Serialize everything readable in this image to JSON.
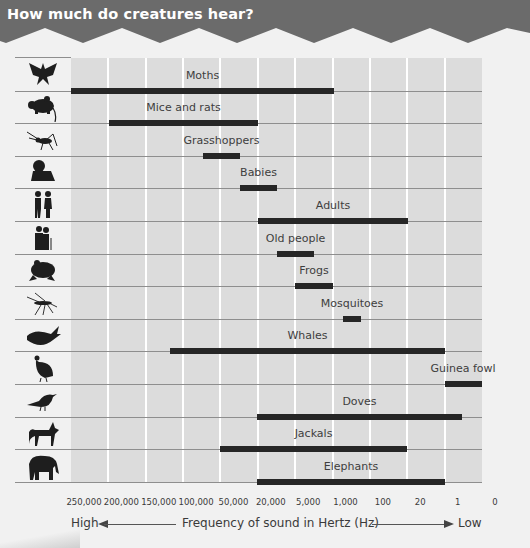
{
  "header": {
    "title": "How much do creatures hear?",
    "color": "#6b6b6b"
  },
  "axis": {
    "high_label": "High",
    "low_label": "Low",
    "xlabel": "Frequency of sound in Hertz (Hz)",
    "ticks": [
      "250,000",
      "200,000",
      "150,000",
      "100,000",
      "50,000",
      "20,000",
      "5,000",
      "1,000",
      "100",
      "20",
      "1",
      "0"
    ]
  },
  "rows": [
    {
      "label": "Moths",
      "icon": "moth-icon"
    },
    {
      "label": "Mice and rats",
      "icon": "mouse-icon"
    },
    {
      "label": "Grasshoppers",
      "icon": "grasshopper-icon"
    },
    {
      "label": "Babies",
      "icon": "baby-icon"
    },
    {
      "label": "Adults",
      "icon": "adults-icon"
    },
    {
      "label": "Old people",
      "icon": "old-people-icon"
    },
    {
      "label": "Frogs",
      "icon": "frog-icon"
    },
    {
      "label": "Mosquitoes",
      "icon": "mosquito-icon"
    },
    {
      "label": "Whales",
      "icon": "whale-icon"
    },
    {
      "label": "Guinea fowl",
      "icon": "guinea-fowl-icon"
    },
    {
      "label": "Doves",
      "icon": "dove-icon"
    },
    {
      "label": "Jackals",
      "icon": "jackal-icon"
    },
    {
      "label": "Elephants",
      "icon": "elephant-icon"
    }
  ],
  "chart_data": {
    "type": "bar",
    "orientation": "horizontal-range",
    "title": "How much do creatures hear?",
    "xlabel": "Frequency of sound in Hertz (Hz)",
    "ylabel": "",
    "x_direction": "High (left) to Low (right)",
    "x_ticks": [
      "250,000",
      "200,000",
      "150,000",
      "100,000",
      "50,000",
      "20,000",
      "5,000",
      "1,000",
      "100",
      "20",
      "1",
      "0"
    ],
    "grid": "vertical",
    "legend": "none",
    "categories": [
      "Moths",
      "Mice and rats",
      "Grasshoppers",
      "Babies",
      "Adults",
      "Old people",
      "Frogs",
      "Mosquitoes",
      "Whales",
      "Guinea fowl",
      "Doves",
      "Jackals",
      "Elephants"
    ],
    "ranges": [
      {
        "name": "Moths",
        "high_hz": 250000,
        "low_hz": 1000
      },
      {
        "name": "Mice and rats",
        "high_hz": 200000,
        "low_hz": 20000
      },
      {
        "name": "Grasshoppers",
        "high_hz": 75000,
        "low_hz": 50000
      },
      {
        "name": "Babies",
        "high_hz": 50000,
        "low_hz": 12000
      },
      {
        "name": "Adults",
        "high_hz": 20000,
        "low_hz": 20
      },
      {
        "name": "Old people",
        "high_hz": 12000,
        "low_hz": 3000
      },
      {
        "name": "Frogs",
        "high_hz": 5000,
        "low_hz": 1000
      },
      {
        "name": "Mosquitoes",
        "high_hz": 500,
        "low_hz": 300
      },
      {
        "name": "Whales",
        "high_hz": 120000,
        "low_hz": 1
      },
      {
        "name": "Guinea fowl",
        "high_hz": 1,
        "low_hz": 0
      },
      {
        "name": "Doves",
        "high_hz": 20000,
        "low_hz": 0.5
      },
      {
        "name": "Jackals",
        "high_hz": 50000,
        "low_hz": 25
      },
      {
        "name": "Elephants",
        "high_hz": 20000,
        "low_hz": 1
      }
    ],
    "bar_pixels": [
      [
        71,
        334
      ],
      [
        109,
        258
      ],
      [
        203,
        240
      ],
      [
        240,
        277
      ],
      [
        258,
        408
      ],
      [
        277,
        314
      ],
      [
        295,
        333
      ],
      [
        343,
        361
      ],
      [
        170,
        445
      ],
      [
        445,
        482
      ],
      [
        257,
        462
      ],
      [
        220,
        407
      ],
      [
        257,
        445
      ]
    ]
  }
}
